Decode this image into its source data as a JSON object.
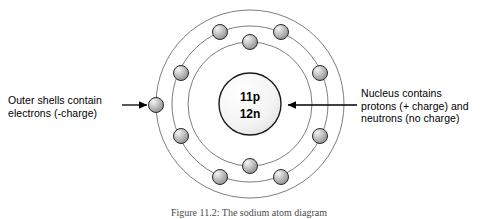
{
  "figure": {
    "caption": "Figure 11.2: The sodium atom diagram",
    "background_color": "#ffffff"
  },
  "nucleus": {
    "protons_label": "11p",
    "neutrons_label": "12n",
    "fill_color": "#f2f2f2",
    "stroke_color": "#1a1a1a"
  },
  "shells": {
    "stroke_color": "#666666",
    "radii": [
      94,
      78,
      62
    ],
    "electron_counts": [
      1,
      8,
      2
    ]
  },
  "electron": {
    "fill_color": "#a8a8a8",
    "highlight_color": "#efefef",
    "stroke_color": "#2b2b2b",
    "radius": 7.5
  },
  "annotations": {
    "left": {
      "line1": "Outer shells contain",
      "line2": "electrons (-charge)",
      "arrow_direction": "right",
      "arrow_color": "#000000"
    },
    "right": {
      "line1": "Nucleus contains",
      "line2": "protons (+ charge) and",
      "line3": "neutrons (no charge)",
      "arrow_direction": "left",
      "arrow_color": "#000000"
    }
  }
}
